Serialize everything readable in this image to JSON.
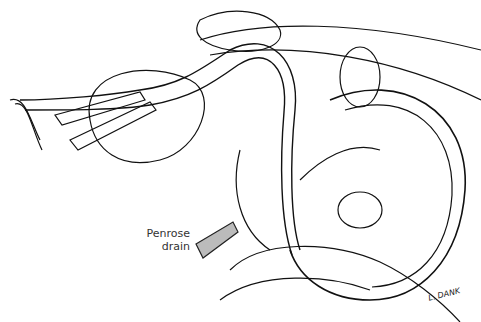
{
  "figure": {
    "labels": [
      {
        "id": "penrose",
        "lines": [
          "Penrose",
          "drain"
        ]
      }
    ],
    "signature": "L. DANK"
  }
}
